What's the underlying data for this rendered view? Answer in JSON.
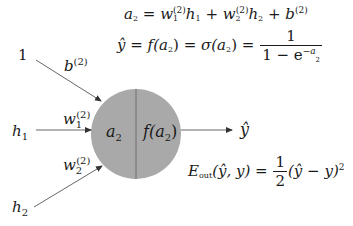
{
  "diagram": {
    "type": "single-neuron",
    "colors": {
      "neuron_fill": "#a9a9a9",
      "neuron_divider": "#6f6f6f",
      "arrow": "#333333",
      "text": "#1a1a1a",
      "background": "#ffffff"
    },
    "inputs": [
      {
        "label": "1",
        "weight_label": "b",
        "weight_sup": "(2)"
      },
      {
        "label": "h",
        "label_sub": "1",
        "weight_label": "w",
        "weight_sub": "1",
        "weight_sup": "(2)"
      },
      {
        "label": "h",
        "label_sub": "2",
        "weight_label": "w",
        "weight_sub": "2",
        "weight_sup": "(2)"
      }
    ],
    "neuron": {
      "left_label": "a",
      "left_sub": "2",
      "right_label": "f(a",
      "right_sub": "2",
      "right_close": ")"
    },
    "output": {
      "label": "ŷ"
    },
    "equations": {
      "preactivation": {
        "lhs": "a",
        "lhs_sub": "2",
        "eq": " = ",
        "t1": "w",
        "t1_sub": "1",
        "t1_sup": "(2)",
        "t1_h": "h",
        "t1_h_sub": "1",
        "plus1": " + ",
        "t2": "w",
        "t2_sub": "2",
        "t2_sup": "(2)",
        "t2_h": "h",
        "t2_h_sub": "2",
        "plus2": " + ",
        "t3": "b",
        "t3_sup": "(2)"
      },
      "activation": {
        "lhs": "ŷ",
        "eq1": " = ",
        "f": "f(a",
        "f_sub": "2",
        "f_close": ")",
        "eq2": " = ",
        "sigma": "σ(a",
        "sigma_sub": "2",
        "sigma_close": ")",
        "eq3": " = ",
        "numerator": "1",
        "den_prefix": "1 − e",
        "den_exp": "−a",
        "den_exp_sub": "2"
      },
      "loss": {
        "lhs": "E",
        "lhs_sub": "out",
        "args": "(ŷ, y)",
        "eq": " = ",
        "numerator": "1",
        "denominator": "2",
        "rhs": "(ŷ − y)",
        "rhs_sup": "2"
      }
    }
  }
}
